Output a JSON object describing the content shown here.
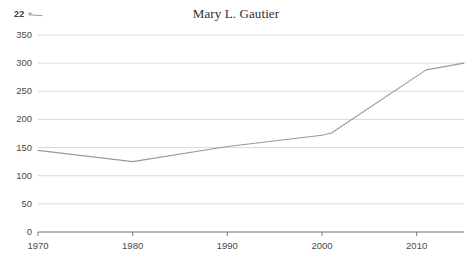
{
  "corner": {
    "number": "22",
    "icon": "sparkline-icon"
  },
  "chart_data": {
    "type": "line",
    "title": "Mary L. Gautier",
    "xlabel": "",
    "ylabel": "",
    "xlim": [
      1970,
      2015
    ],
    "ylim": [
      0,
      350
    ],
    "grid": true,
    "legend": "none",
    "line_color": "#9a9a9a",
    "axis_color": "#6f6f6f",
    "grid_color": "#d0d0d0",
    "x_ticks": [
      1970,
      1980,
      1990,
      2000,
      2010
    ],
    "x_tick_labels": [
      "1970",
      "1980",
      "1990",
      "2000",
      "2010"
    ],
    "y_ticks": [
      0,
      50,
      100,
      150,
      200,
      250,
      300,
      350
    ],
    "y_tick_labels": [
      "0",
      "50",
      "100",
      "150",
      "200",
      "250",
      "300",
      "350"
    ],
    "series": [
      {
        "name": "Mary L. Gautier",
        "x": [
          1970,
          1980,
          1990,
          2000,
          2001,
          2011,
          2015
        ],
        "values": [
          145,
          125,
          152,
          172,
          176,
          288,
          300
        ]
      }
    ]
  }
}
